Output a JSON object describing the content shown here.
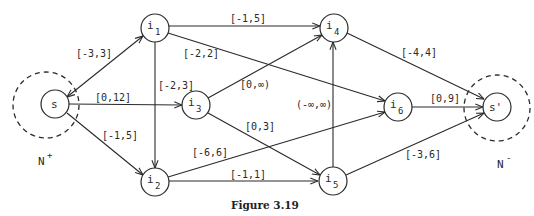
{
  "caption": "Figure 3.19",
  "set_labels": {
    "source_set": {
      "text": "N",
      "sup": "+"
    },
    "sink_set": {
      "text": "N",
      "sup": "-"
    }
  },
  "nodes": {
    "s": {
      "name": "s",
      "sub": ""
    },
    "i1": {
      "name": "i",
      "sub": "1"
    },
    "i2": {
      "name": "i",
      "sub": "2"
    },
    "i3": {
      "name": "i",
      "sub": "3"
    },
    "i4": {
      "name": "i",
      "sub": "4"
    },
    "i5": {
      "name": "i",
      "sub": "5"
    },
    "i6": {
      "name": "i",
      "sub": "6"
    },
    "t": {
      "name": "s'",
      "sub": ""
    }
  },
  "edges": {
    "s_i1": {
      "from": "s",
      "to": "i1",
      "label": "[-3,3]"
    },
    "s_i3": {
      "from": "s",
      "to": "i3",
      "label": "[0,12]"
    },
    "s_i2": {
      "from": "s",
      "to": "i2",
      "label": "[-1,5]"
    },
    "i1_i2": {
      "from": "i1",
      "to": "i2",
      "label": "[-2,3]"
    },
    "i1_i4": {
      "from": "i1",
      "to": "i4",
      "label": "[-1,5]"
    },
    "i1_i6": {
      "from": "i1",
      "to": "i6",
      "label": "[-2,2]"
    },
    "i3_i4": {
      "from": "i3",
      "to": "i4",
      "label": "[0,∞)"
    },
    "i3_i5": {
      "from": "i3",
      "to": "i5",
      "label": "[0,3]"
    },
    "i2_i6": {
      "from": "i2",
      "to": "i6",
      "label": "[-6,6]"
    },
    "i2_i5": {
      "from": "i2",
      "to": "i5",
      "label": "[-1,1]"
    },
    "i5_i4": {
      "from": "i5",
      "to": "i4",
      "label": "(-∞,∞)"
    },
    "i4_t": {
      "from": "i4",
      "to": "s'",
      "label": "[-4,4]"
    },
    "i6_t": {
      "from": "i6",
      "to": "s'",
      "label": "[0,9]"
    },
    "i5_t": {
      "from": "i5",
      "to": "s'",
      "label": "[-3,6]"
    }
  }
}
